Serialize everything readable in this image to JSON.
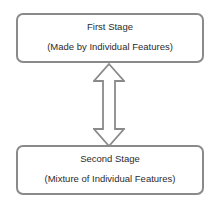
{
  "diagram": {
    "nodes": [
      {
        "id": "first-stage",
        "title": "First Stage",
        "subtitle": "(Made by Individual Features)"
      },
      {
        "id": "second-stage",
        "title": "Second Stage",
        "subtitle": "(Mixture of Individual Features)"
      }
    ],
    "edges": [
      {
        "from": "first-stage",
        "to": "second-stage",
        "type": "bidirectional-block-arrow"
      }
    ],
    "colors": {
      "border": "#8a8a8a",
      "text": "#2b2b2b",
      "background": "#ffffff"
    }
  }
}
